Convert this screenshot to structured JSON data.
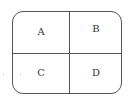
{
  "diagram": {
    "type": "2x2 grid in rounded rectangle",
    "cells": [
      {
        "label": "A",
        "position": "top-left"
      },
      {
        "label": "B",
        "position": "top-right"
      },
      {
        "label": "C",
        "position": "bottom-left"
      },
      {
        "label": "D",
        "position": "bottom-right"
      }
    ],
    "colors": {
      "border": "#555555",
      "text": "#333333",
      "background": "#ffffff"
    }
  }
}
